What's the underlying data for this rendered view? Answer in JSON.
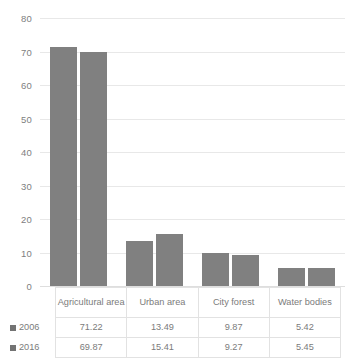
{
  "chart_data": {
    "type": "bar",
    "title": "",
    "xlabel": "",
    "ylabel": "",
    "categories": [
      "Agricultural area",
      "Urban area",
      "City forest",
      "Water bodies"
    ],
    "series": [
      {
        "name": "2006",
        "values": [
          71.22,
          13.49,
          9.87,
          5.42
        ]
      },
      {
        "name": "2016",
        "values": [
          69.87,
          15.41,
          9.27,
          5.45
        ]
      }
    ],
    "ylim": [
      0,
      80
    ],
    "ytick_step": 10,
    "yticks": [
      0,
      10,
      20,
      30,
      40,
      50,
      60,
      70,
      80
    ],
    "ytick_labels": [
      "0",
      "10",
      "20",
      "30",
      "40",
      "50",
      "60",
      "70",
      "80"
    ],
    "grid": true,
    "grid_axis": "y",
    "legend": "data-table",
    "legend_position": "bottom",
    "data_table_visible": true,
    "bar_color": "#808080",
    "gridline_color": "#e8e8e8",
    "text_color": "#7b7b7b"
  },
  "data_table": {
    "rows": [
      {
        "label": "2006",
        "values": [
          "71.22",
          "13.49",
          "9.87",
          "5.42"
        ]
      },
      {
        "label": "2016",
        "values": [
          "69.87",
          "15.41",
          "9.27",
          "5.45"
        ]
      }
    ]
  }
}
